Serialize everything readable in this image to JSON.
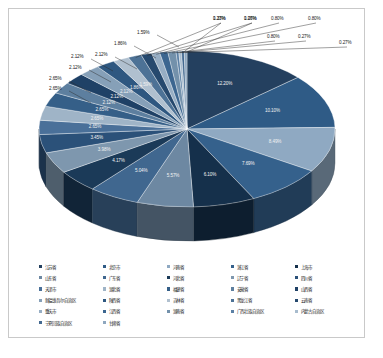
{
  "chart_data": {
    "type": "pie",
    "title": "",
    "subtitle": "",
    "xlabel": "",
    "ylabel": "",
    "legend_position": "bottom",
    "grid": false,
    "three_d": true,
    "value_suffix": "%",
    "categories": [
      "江苏省",
      "北京市",
      "河南省",
      "浙江省",
      "上海市",
      "山东省",
      "广东省",
      "河北省",
      "辽宁省",
      "四川省",
      "天津市",
      "湖北省",
      "福建省",
      "安徽省",
      "山西省",
      "新疆维吾尔自治区",
      "陕西省",
      "吉林省",
      "黑龙江省",
      "云南省",
      "重庆市",
      "江西省",
      "湖南省",
      "广西壮族自治区",
      "内蒙古自治区",
      "宁夏回族自治区",
      "甘肃省"
    ],
    "values": [
      12.2,
      10.1,
      8.49,
      7.69,
      6.1,
      5.57,
      5.04,
      4.17,
      3.98,
      3.45,
      2.65,
      2.65,
      2.65,
      2.12,
      2.12,
      2.12,
      1.86,
      1.59,
      1.33,
      1.06,
      0.8,
      0.8,
      0.8,
      0.27,
      0.27,
      0.27,
      0.27
    ],
    "labels": [
      "12.20%",
      "10.10%",
      "8.49%",
      "7.69%",
      "6.10%",
      "5.57%",
      "5.04%",
      "4.17%",
      "3.98%",
      "3.45%",
      "2.65%",
      "2.65%",
      "2.65%",
      "2.12%",
      "2.12%",
      "2.12%",
      "1.86%",
      "1.59%",
      "1.33%",
      "1.06%",
      "0.80%",
      "0.80%",
      "0.80%",
      "0.27%",
      "0.27%",
      "0.27%",
      "0.27%"
    ],
    "colors": [
      "#24405f",
      "#2f5b86",
      "#8fa9c2",
      "#35618c",
      "#15304b",
      "#6d88a2",
      "#40678f",
      "#1b3a58",
      "#7e97ae",
      "#2b5179",
      "#4a7099",
      "#9fb4c7",
      "#355f88",
      "#5d7f9f",
      "#1f4166",
      "#86a0b8",
      "#2e5780",
      "#b0c0cf",
      "#4d7296",
      "#26496e",
      "#97aec4",
      "#3c6690",
      "#7391ab",
      "#5b80a5",
      "#a8bcce",
      "#436990",
      "#8ea7bf"
    ]
  },
  "callouts": {
    "top": [
      "0.80%",
      "0.80%",
      "0.80%",
      "0.27%",
      "1.06%",
      "0.27%",
      "0.27%",
      "1.33%",
      "0.27%"
    ],
    "left": [
      "1.59%",
      "1.86%",
      "2.12%",
      "2.12%",
      "2.12%",
      "2.65%",
      "2.65%"
    ],
    "inner": [
      "2.65%",
      "3.45%",
      "3.98%",
      "4.17%",
      "5.04%",
      "5.57%",
      "6.10%",
      "7.69%",
      "8.49%",
      "10.10%",
      "12.20%"
    ]
  },
  "legend": {
    "rows": [
      [
        {
          "label": "江苏省",
          "color": "#24405f"
        },
        {
          "label": "北京市",
          "color": "#2f5b86"
        },
        {
          "label": "河南省",
          "color": "#8fa9c2"
        },
        {
          "label": "浙江省",
          "color": "#35618c"
        },
        {
          "label": "上海市",
          "color": "#15304b"
        }
      ],
      [
        {
          "label": "山东省",
          "color": "#6d88a2"
        },
        {
          "label": "广东省",
          "color": "#40678f"
        },
        {
          "label": "河北省",
          "color": "#1b3a58"
        },
        {
          "label": "辽宁省",
          "color": "#7e97ae"
        },
        {
          "label": "四川省",
          "color": "#2b5179"
        }
      ],
      [
        {
          "label": "天津市",
          "color": "#4a7099"
        },
        {
          "label": "湖北省",
          "color": "#9fb4c7"
        },
        {
          "label": "福建省",
          "color": "#355f88"
        },
        {
          "label": "安徽省",
          "color": "#5d7f9f"
        },
        {
          "label": "山西省",
          "color": "#1f4166"
        }
      ],
      [
        {
          "label": "新疆维吾尔自治区",
          "color": "#86a0b8"
        },
        {
          "label": "陕西省",
          "color": "#2e5780"
        },
        {
          "label": "吉林省",
          "color": "#b0c0cf"
        },
        {
          "label": "黑龙江省",
          "color": "#4d7296"
        },
        {
          "label": "云南省",
          "color": "#26496e"
        }
      ],
      [
        {
          "label": "重庆市",
          "color": "#97aec4"
        },
        {
          "label": "江西省",
          "color": "#3c6690"
        },
        {
          "label": "湖南省",
          "color": "#7391ab"
        },
        {
          "label": "广西壮族自治区",
          "color": "#5b80a5"
        },
        {
          "label": "内蒙古自治区",
          "color": "#a8bcce"
        }
      ],
      [
        {
          "label": "宁夏回族自治区",
          "color": "#436990"
        },
        {
          "label": "甘肃省",
          "color": "#8ea7bf"
        }
      ]
    ]
  }
}
